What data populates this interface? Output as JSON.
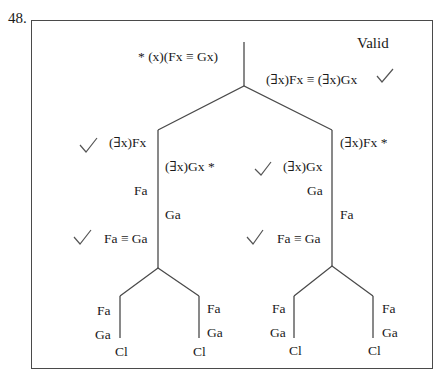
{
  "problem_number": "48.",
  "verdict": "Valid",
  "premise": "* (x)(Fx ≡ Gx)",
  "negated_conclusion": "(∃x)Fx ≡ (∃x)Gx",
  "left_branch": {
    "line1": "(∃x)Fx",
    "line2": "(∃x)Gx *",
    "line3": "Fa",
    "line4": "Ga",
    "line5": "Fa ≡ Ga",
    "left_leaf": {
      "a": "Fa",
      "b": "Ga",
      "close": "Cl"
    },
    "right_leaf": {
      "a": "Fa",
      "b": "Ga",
      "close": "Cl"
    }
  },
  "right_branch": {
    "line1": "(∃x)Fx *",
    "line2": "(∃x)Gx",
    "line3": "Ga",
    "line4": "Fa",
    "line5": "Fa ≡ Ga",
    "left_leaf": {
      "a": "Fa",
      "b": "Ga",
      "close": "Cl"
    },
    "right_leaf": {
      "a": "Fa",
      "b": "Ga",
      "close": "Cl"
    }
  },
  "checkmark_icon": "✓"
}
